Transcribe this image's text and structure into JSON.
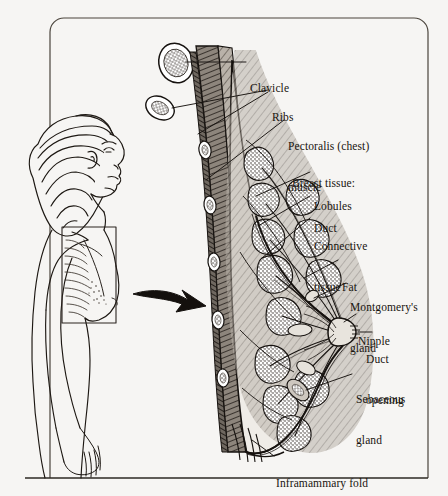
{
  "illustration": {
    "title": "Cross-section of the breast",
    "background_color": "#f6f5f3",
    "ink_color": "#1a1613",
    "frame": {
      "name": "rounded-border-frame",
      "x": 50,
      "y": 18,
      "width": 378,
      "height": 460,
      "corner_radius": 14
    },
    "woman_figure": {
      "name": "woman-profile-figure",
      "description": "side profile of a woman facing right, left arm down, hair tied back",
      "callout_box": {
        "x": 62,
        "y": 227,
        "width": 54,
        "height": 96
      }
    },
    "arrow": {
      "name": "magnify-arrow",
      "description": "curved arrow pointing right from profile to cross-section"
    },
    "labels": [
      {
        "id": "clavicle",
        "text": "Clavicle",
        "x": 250,
        "y": 55,
        "lines": [
          "Clavicle"
        ]
      },
      {
        "id": "ribs",
        "text": "Ribs",
        "x": 272,
        "y": 84,
        "lines": [
          "Ribs"
        ]
      },
      {
        "id": "pectoralis",
        "text": "Pectoralis (chest) muscle",
        "x": 288,
        "y": 113,
        "lines": [
          "Pectoralis (chest)",
          "muscle"
        ]
      },
      {
        "id": "breast-tissue",
        "text": "Breast tissue:",
        "x": 292,
        "y": 150,
        "lines": [
          "Breast tissue:"
        ]
      },
      {
        "id": "lobules",
        "text": "Lobules",
        "x": 314,
        "y": 173,
        "lines": [
          "Lobules"
        ]
      },
      {
        "id": "duct",
        "text": "Duct",
        "x": 314,
        "y": 195,
        "lines": [
          "Duct"
        ]
      },
      {
        "id": "connective-tissue",
        "text": "Connective tissue",
        "x": 314,
        "y": 211,
        "lines": [
          "Connective",
          "tissue"
        ]
      },
      {
        "id": "fat",
        "text": "Fat",
        "x": 342,
        "y": 258,
        "lines": [
          "Fat"
        ]
      },
      {
        "id": "montgomerys-gland",
        "text": "Montgomery's gland",
        "x": 350,
        "y": 277,
        "lines": [
          "Montgomery's",
          "gland"
        ]
      },
      {
        "id": "nipple",
        "text": "Nipple",
        "x": 358,
        "y": 312,
        "lines": [
          "Nipple"
        ]
      },
      {
        "id": "duct-opening",
        "text": "Duct opening",
        "x": 364,
        "y": 330,
        "lines": [
          "Duct",
          "opening"
        ]
      },
      {
        "id": "sebaceous-gland",
        "text": "Sebaceous gland",
        "x": 356,
        "y": 370,
        "lines": [
          "Sebaceous",
          "gland"
        ]
      },
      {
        "id": "inframammary-fold",
        "text": "Inframammary fold",
        "x": 236,
        "y": 452,
        "lines": [
          "Inframammary fold"
        ]
      }
    ]
  }
}
